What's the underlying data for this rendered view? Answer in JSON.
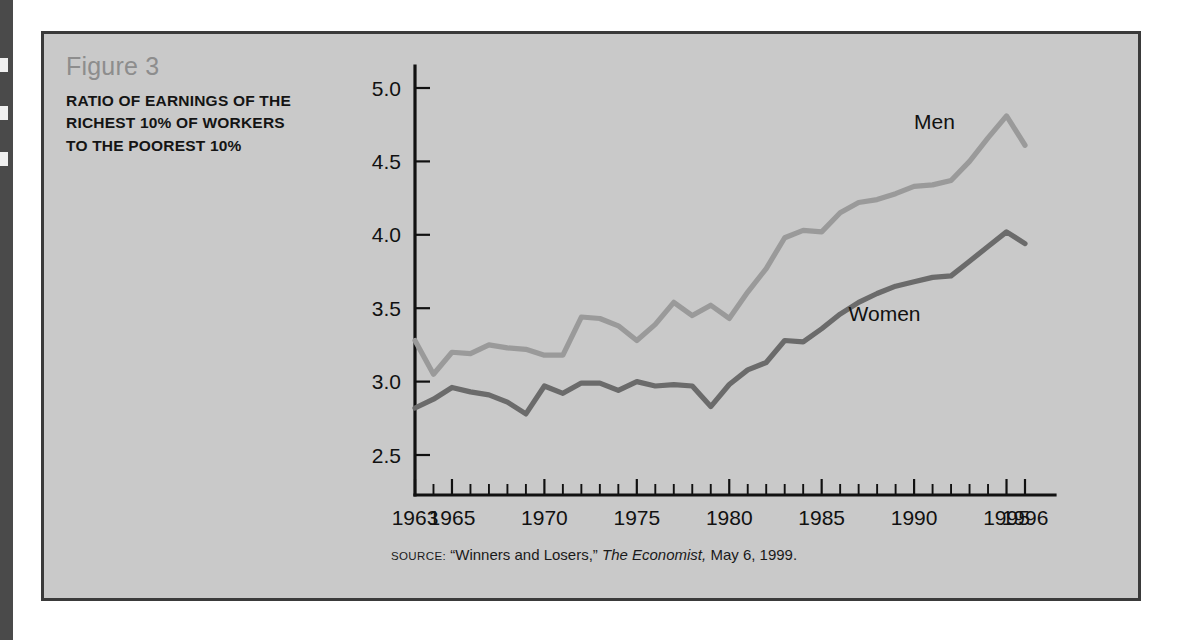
{
  "figure": {
    "number_label": "Figure 3",
    "title": "RATIO OF EARNINGS OF THE RICHEST 10% OF WORKERS TO THE POOREST 10%",
    "source_prefix": "SOURCE:",
    "source_article": "“Winners and Losers,”",
    "source_publication": "The Economist,",
    "source_date": "May 6, 1999."
  },
  "colors": {
    "panel_background": "#c9c9c9",
    "panel_border": "#3a3a3a",
    "axis": "#111111",
    "men_series": "#9a9a9a",
    "women_series": "#6b6b6b",
    "figure_number_text": "#8d8d8d",
    "title_text": "#141414"
  },
  "chart_data": {
    "type": "line",
    "title": "RATIO OF EARNINGS OF THE RICHEST 10% OF WORKERS TO THE POOREST 10%",
    "subtitle": "Figure 3",
    "xlabel": "",
    "ylabel": "",
    "xlim": [
      1963,
      1996
    ],
    "ylim": [
      2.35,
      5.15
    ],
    "yticks": [
      2.5,
      3.0,
      3.5,
      4.0,
      4.5,
      5.0
    ],
    "ytick_labels": [
      "2.5",
      "3.0",
      "3.5",
      "4.0",
      "4.5",
      "5.0"
    ],
    "xticks": [
      1963,
      1964,
      1965,
      1966,
      1967,
      1968,
      1969,
      1970,
      1971,
      1972,
      1973,
      1974,
      1975,
      1976,
      1977,
      1978,
      1979,
      1980,
      1981,
      1982,
      1983,
      1984,
      1985,
      1986,
      1987,
      1988,
      1989,
      1990,
      1991,
      1992,
      1993,
      1994,
      1995,
      1996
    ],
    "xtick_labels": [
      {
        "year": 1963,
        "label": "1963"
      },
      {
        "year": 1965,
        "label": "1965"
      },
      {
        "year": 1970,
        "label": "1970"
      },
      {
        "year": 1975,
        "label": "1975"
      },
      {
        "year": 1980,
        "label": "1980"
      },
      {
        "year": 1985,
        "label": "1985"
      },
      {
        "year": 1990,
        "label": "1990"
      },
      {
        "year": 1995,
        "label": "1995"
      },
      {
        "year": 1996,
        "label": "1996"
      }
    ],
    "grid": false,
    "legend": "inline-annotations",
    "x": [
      1963,
      1964,
      1965,
      1966,
      1967,
      1968,
      1969,
      1970,
      1971,
      1972,
      1973,
      1974,
      1975,
      1976,
      1977,
      1978,
      1979,
      1980,
      1981,
      1982,
      1983,
      1984,
      1985,
      1986,
      1987,
      1988,
      1989,
      1990,
      1991,
      1992,
      1993,
      1994,
      1995,
      1996
    ],
    "series": [
      {
        "name": "Men",
        "color": "#9a9a9a",
        "label_position": {
          "year": 1991.1,
          "value": 4.72
        },
        "values": [
          3.28,
          3.05,
          3.2,
          3.19,
          3.25,
          3.23,
          3.22,
          3.18,
          3.18,
          3.44,
          3.43,
          3.38,
          3.28,
          3.39,
          3.54,
          3.45,
          3.52,
          3.43,
          3.61,
          3.77,
          3.98,
          4.03,
          4.02,
          4.15,
          4.22,
          4.24,
          4.28,
          4.33,
          4.34,
          4.37,
          4.5,
          4.66,
          4.81,
          4.61
        ]
      },
      {
        "name": "Women",
        "color": "#6b6b6b",
        "label_position": {
          "year": 1988.4,
          "value": 3.41
        },
        "values": [
          2.82,
          2.88,
          2.96,
          2.93,
          2.91,
          2.86,
          2.78,
          2.97,
          2.92,
          2.99,
          2.99,
          2.94,
          3.0,
          2.97,
          2.98,
          2.97,
          2.83,
          2.98,
          3.08,
          3.13,
          3.28,
          3.27,
          3.36,
          3.46,
          3.54,
          3.6,
          3.65,
          3.68,
          3.71,
          3.72,
          3.82,
          3.92,
          4.02,
          3.94
        ]
      }
    ]
  }
}
